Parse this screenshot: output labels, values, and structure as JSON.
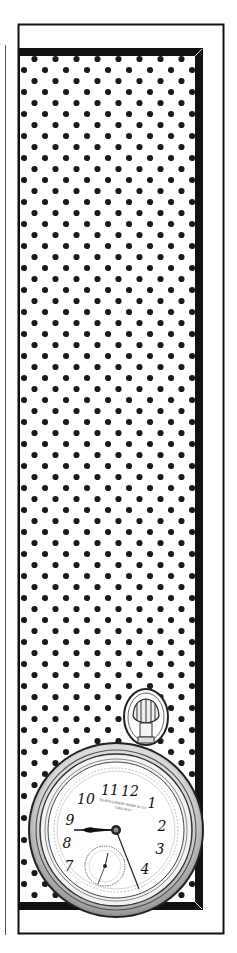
{
  "illustration": {
    "subject": "Vintage pocket watch advertisement",
    "background_pattern": "polka-dot",
    "colors": {
      "ink": "#111111",
      "paper": "#ffffff",
      "dot": "#1a1a1a"
    }
  },
  "watch": {
    "brand_line_1": "MONTGOMERY WARD & CO.",
    "brand_line_2": "CHICAGO",
    "numerals": [
      "12",
      "1",
      "2",
      "3",
      "4",
      "5",
      "6",
      "7",
      "8",
      "9",
      "10",
      "11"
    ],
    "hands": {
      "hour": "9",
      "minute": "5"
    }
  }
}
